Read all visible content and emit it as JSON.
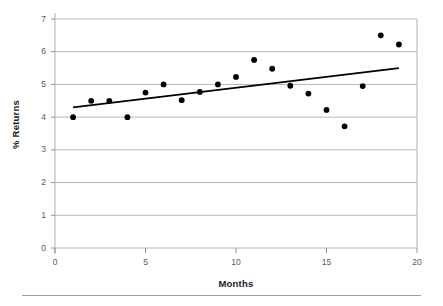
{
  "chart_data": {
    "type": "scatter",
    "title": "",
    "xlabel": "Months",
    "ylabel": "% Returns",
    "xlim": [
      0,
      20
    ],
    "ylim": [
      0,
      7
    ],
    "xticks": [
      0,
      5,
      10,
      15,
      20
    ],
    "yticks": [
      0,
      1,
      2,
      3,
      4,
      5,
      6,
      7
    ],
    "grid": "horizontal",
    "legend": "none",
    "marker_color": "#000000",
    "trendline_color": "#000000",
    "gridline_color": "#b4b8bb",
    "x": [
      1,
      2,
      3,
      4,
      5,
      6,
      7,
      8,
      9,
      10,
      11,
      12,
      13,
      14,
      15,
      16,
      17,
      18,
      19
    ],
    "y": [
      4.0,
      4.5,
      4.5,
      4.0,
      4.75,
      5.0,
      4.52,
      4.77,
      5.0,
      5.23,
      5.75,
      5.48,
      4.96,
      4.72,
      4.22,
      3.72,
      4.95,
      6.5,
      6.22
    ],
    "series": [
      {
        "name": "Observed returns",
        "type": "scatter",
        "points": [
          {
            "x": 1,
            "y": 4.0
          },
          {
            "x": 2,
            "y": 4.5
          },
          {
            "x": 3,
            "y": 4.5
          },
          {
            "x": 4,
            "y": 4.0
          },
          {
            "x": 5,
            "y": 4.75
          },
          {
            "x": 6,
            "y": 5.0
          },
          {
            "x": 7,
            "y": 4.52
          },
          {
            "x": 8,
            "y": 4.77
          },
          {
            "x": 9,
            "y": 5.0
          },
          {
            "x": 10,
            "y": 5.23
          },
          {
            "x": 11,
            "y": 5.75
          },
          {
            "x": 12,
            "y": 5.48
          },
          {
            "x": 13,
            "y": 4.96
          },
          {
            "x": 14,
            "y": 4.72
          },
          {
            "x": 15,
            "y": 4.22
          },
          {
            "x": 16,
            "y": 3.72
          },
          {
            "x": 17,
            "y": 4.95
          },
          {
            "x": 18,
            "y": 6.5
          },
          {
            "x": 19,
            "y": 6.22
          }
        ]
      },
      {
        "name": "Trend line",
        "type": "line",
        "points": [
          {
            "x": 1,
            "y": 4.3
          },
          {
            "x": 19,
            "y": 5.5
          }
        ]
      }
    ]
  }
}
